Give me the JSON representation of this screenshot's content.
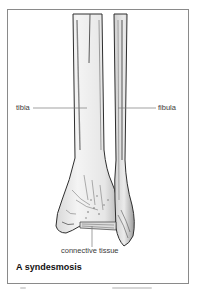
{
  "figure": {
    "labels": {
      "tibia": "tibia",
      "fibula": "fibula",
      "connective_tissue": "connective tissue"
    },
    "caption": "A syndesmosis"
  },
  "colors": {
    "border": "#8a8a8a",
    "bone_outline": "#2e2e2e",
    "bone_fill": "#efefef",
    "leader_line": "#7a7a7a",
    "caption_text": "#111111"
  }
}
